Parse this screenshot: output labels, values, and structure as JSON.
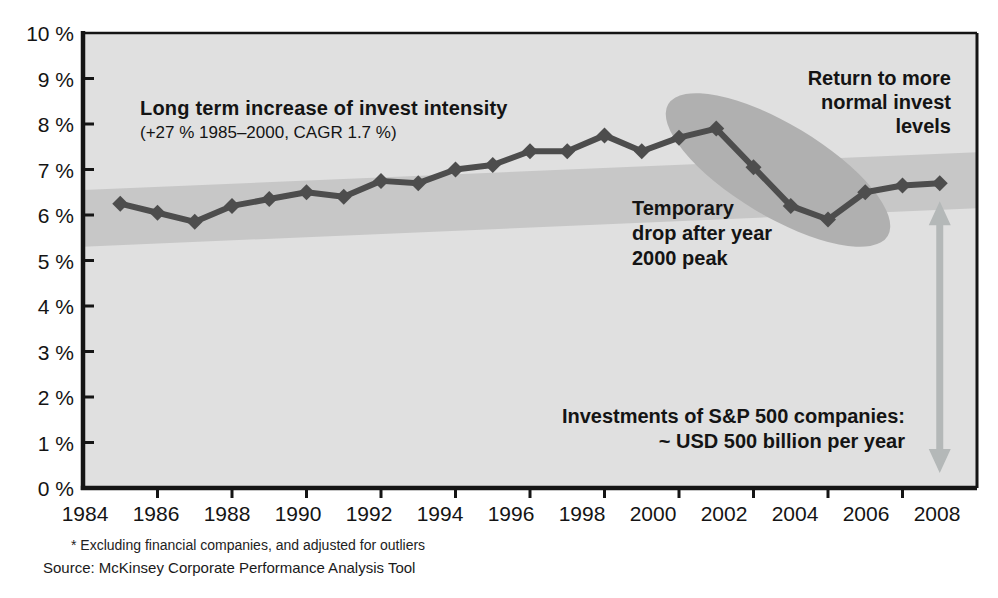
{
  "chart_data": {
    "type": "line",
    "title": "Long term increase of invest intensity",
    "subtitle": "(+27 % 1985–2000, CAGR 1.7 %)",
    "series_name": "Invest intensity",
    "x": [
      1985,
      1986,
      1987,
      1988,
      1989,
      1990,
      1991,
      1992,
      1993,
      1994,
      1995,
      1996,
      1997,
      1998,
      1999,
      2000,
      2001,
      2002,
      2003,
      2004,
      2005,
      2006,
      2007
    ],
    "values": [
      6.25,
      6.05,
      5.85,
      6.2,
      6.35,
      6.5,
      6.4,
      6.75,
      6.7,
      7.0,
      7.1,
      7.4,
      7.4,
      7.75,
      7.4,
      7.7,
      7.9,
      7.05,
      6.2,
      5.9,
      6.5,
      6.65,
      6.7
    ],
    "xlim": [
      1984,
      2008
    ],
    "ylim": [
      0,
      10
    ],
    "grid": "off",
    "legend": "none",
    "marker": "diamond",
    "x_tick_labels": [
      "1984",
      "1986",
      "1988",
      "1990",
      "1992",
      "1994",
      "1996",
      "1998",
      "2000",
      "2002",
      "2004",
      "2006",
      "2008"
    ],
    "y_tick_labels": [
      "0 %",
      "1 %",
      "2 %",
      "3 %",
      "4 %",
      "5 %",
      "6 %",
      "7 %",
      "8 %",
      "9 %",
      "10 %"
    ],
    "annotations": {
      "temporary_drop": "Temporary\ndrop after year\n2000 peak",
      "return_to_normal": "Return to more\nnormal invest\nlevels",
      "investments_magnitude": "Investments of S&P 500 companies:\n~ USD 500 billion per year"
    },
    "trend_band": {
      "start_year": 1984,
      "start_range": [
        5.3,
        6.55
      ],
      "end_year": 2008,
      "end_range": [
        6.15,
        7.38
      ]
    },
    "drop_highlight": {
      "covers_years": [
        2000,
        2005
      ]
    },
    "magnitude_arrow": {
      "year": 2007,
      "value_range": [
        0.33,
        6.3
      ]
    },
    "colors": {
      "page_bg": "#ffffff",
      "plot_bg": "#e0e0e0",
      "trend_band": "#c7c7c7",
      "highlight_ellipse": "#b0b0b0",
      "arrow": "#b4b8b8",
      "line": "#4d4d4d",
      "axis": "#151515",
      "text": "#141414"
    }
  },
  "footnote": "* Excluding financial companies, and adjusted for outliers",
  "source": "Source: McKinsey Corporate Performance Analysis Tool"
}
